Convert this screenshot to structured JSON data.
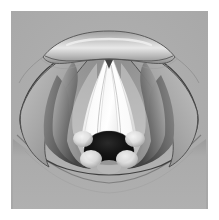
{
  "figure": {
    "view": "superior laryngoscopic view",
    "style": "grayscale medical illustration",
    "caption": "",
    "panel": {
      "x": 11,
      "y": 11,
      "width": 197,
      "height": 198,
      "background_color": "#acacac",
      "page_margin_color": "#ffffff"
    },
    "palette": {
      "page_background": "#ffffff",
      "panel_background": "#acacac",
      "mucosa_light": "#d9d9d9",
      "mucosa_mid": "#9a9a9a",
      "mucosa_dark": "#5b5b5b",
      "recess_shadow": "#3c3c3c",
      "vocal_cord_white": "#fbfbfb",
      "vocal_cord_shade": "#d0d0d0",
      "tubercle_highlight": "#ededed",
      "glottic_airway_black": "#0d0d0d",
      "outline_stroke": "#3a3a3a",
      "faint_line": "#8f8f8f"
    },
    "structures": [
      {
        "id": "epiglottis",
        "label": "Epiglottis",
        "position": "superior midline",
        "tone": "light gray highlighted band"
      },
      {
        "id": "pharyngoepiglottic-fold-left",
        "label": "Pharyngoepiglottic fold (left)",
        "position": "upper left",
        "tone": "faint contour line"
      },
      {
        "id": "pharyngoepiglottic-fold-right",
        "label": "Pharyngoepiglottic fold (right)",
        "position": "upper right",
        "tone": "faint contour line"
      },
      {
        "id": "aryepiglottic-fold-left",
        "label": "Aryepiglottic fold (left)",
        "position": "left lateral",
        "tone": "graded gray fold"
      },
      {
        "id": "aryepiglottic-fold-right",
        "label": "Aryepiglottic fold (right)",
        "position": "right lateral",
        "tone": "graded gray fold"
      },
      {
        "id": "piriform-recess-left",
        "label": "Piriform recess (left)",
        "position": "left lateral deep",
        "tone": "dark shadowed recess"
      },
      {
        "id": "piriform-recess-right",
        "label": "Piriform recess (right)",
        "position": "right lateral deep",
        "tone": "dark shadowed recess"
      },
      {
        "id": "vestibular-fold-left",
        "label": "Vestibular fold (left false cord)",
        "position": "left paramedian",
        "tone": "mid gray"
      },
      {
        "id": "vestibular-fold-right",
        "label": "Vestibular fold (right false cord)",
        "position": "right paramedian",
        "tone": "mid gray"
      },
      {
        "id": "vocal-cord-left",
        "label": "Vocal cord (left true cord)",
        "position": "left of midline",
        "tone": "bright white band"
      },
      {
        "id": "vocal-cord-right",
        "label": "Vocal cord (right true cord)",
        "position": "right of midline",
        "tone": "bright white band"
      },
      {
        "id": "anterior-commissure",
        "label": "Anterior commissure",
        "position": "superior midline notch",
        "tone": "dark notch"
      },
      {
        "id": "glottic-airway",
        "label": "Glottic airway / rima glottidis",
        "position": "inferior midline",
        "tone": "black opening"
      },
      {
        "id": "cuneiform-tubercle-left",
        "label": "Cuneiform tubercle (left)",
        "position": "lower left of glottis",
        "tone": "pale rounded bump"
      },
      {
        "id": "cuneiform-tubercle-right",
        "label": "Cuneiform tubercle (right)",
        "position": "lower right of glottis",
        "tone": "pale rounded bump"
      },
      {
        "id": "corniculate-tubercle-left",
        "label": "Corniculate tubercle (left)",
        "position": "inferior left",
        "tone": "pale rounded bump"
      },
      {
        "id": "corniculate-tubercle-right",
        "label": "Corniculate tubercle (right)",
        "position": "inferior right",
        "tone": "pale rounded bump"
      },
      {
        "id": "interarytenoid-notch",
        "label": "Interarytenoid notch",
        "position": "inferior midline",
        "tone": "soft shadow"
      },
      {
        "id": "posterior-pharyngeal-wall",
        "label": "Posterior pharyngeal wall",
        "position": "inferior field",
        "tone": "flat mid gray"
      }
    ]
  }
}
